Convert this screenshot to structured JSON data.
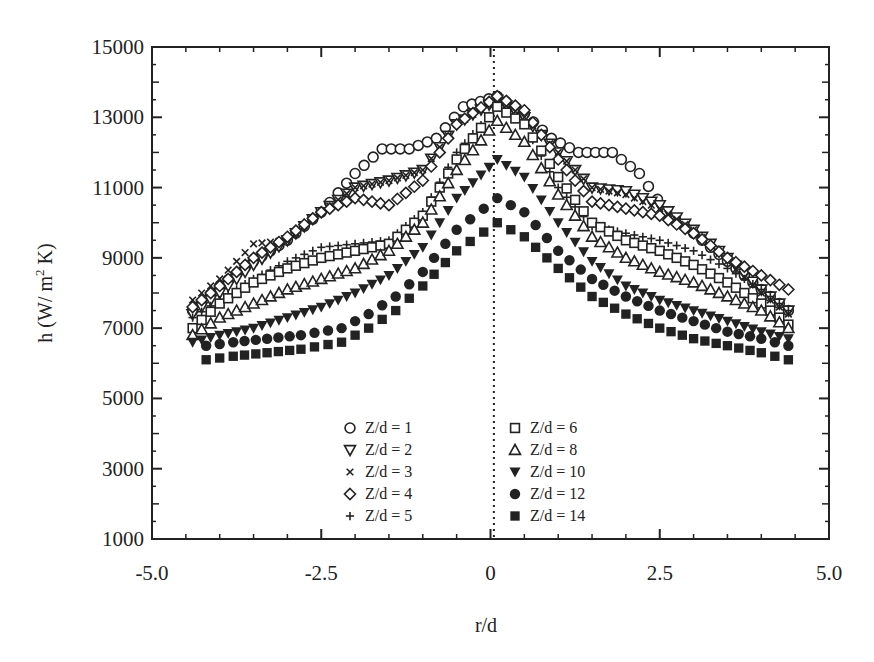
{
  "chart_data": {
    "type": "scatter",
    "title": "",
    "xlabel": "r/d",
    "ylabel": "h (W/ m² K)",
    "ylabel_parts": {
      "main": "h (W/ m",
      "sup": "2",
      "tail": " K)"
    },
    "xlim": [
      -5.0,
      5.0
    ],
    "ylim": [
      1000,
      15000
    ],
    "x_ticks": [
      -5.0,
      -2.5,
      0,
      2.5,
      5.0
    ],
    "x_tick_labels": [
      "-5.0",
      "-2.5",
      "0",
      "2.5",
      "5.0"
    ],
    "y_ticks": [
      1000,
      3000,
      5000,
      7000,
      9000,
      11000,
      13000,
      15000
    ],
    "y_tick_labels": [
      "1000",
      "3000",
      "5000",
      "7000",
      "9000",
      "11000",
      "13000",
      "15000"
    ],
    "grid": false,
    "center_line": {
      "x": 0.05,
      "style": "dotted"
    },
    "legend_position": "lower center, two columns",
    "series": [
      {
        "name": "Z/d = 1",
        "marker": "circle-open",
        "x": [
          -4.4,
          -4.0,
          -3.5,
          -3.0,
          -2.5,
          -2.0,
          -1.6,
          -1.2,
          -0.8,
          -0.4,
          0.1,
          0.5,
          0.9,
          1.3,
          1.8,
          2.2,
          2.6,
          3.0,
          3.5,
          4.0,
          4.4
        ],
        "values": [
          7500,
          8200,
          8900,
          9500,
          10300,
          11400,
          12100,
          12100,
          12400,
          13300,
          13600,
          13100,
          12400,
          12000,
          12000,
          11400,
          10300,
          9700,
          8900,
          8100,
          7500
        ]
      },
      {
        "name": "Z/d = 2",
        "marker": "triangle-down-open",
        "x": [
          -4.4,
          -4.0,
          -3.5,
          -3.0,
          -2.5,
          -2.0,
          -1.5,
          -1.0,
          -0.5,
          0.1,
          0.5,
          1.0,
          1.5,
          2.0,
          2.5,
          3.0,
          3.5,
          4.0,
          4.4
        ],
        "values": [
          7400,
          8000,
          8800,
          9500,
          10300,
          11000,
          11200,
          11500,
          12800,
          13500,
          13000,
          12000,
          11000,
          10900,
          10500,
          9800,
          9000,
          8100,
          7500
        ]
      },
      {
        "name": "Z/d = 3",
        "marker": "x",
        "x": [
          -4.4,
          -4.0,
          -3.5,
          -3.0,
          -2.5,
          -2.0,
          -1.5,
          -1.0,
          -0.5,
          0.1,
          0.5,
          1.0,
          1.5,
          2.0,
          2.5,
          3.0,
          3.5,
          4.0,
          4.4
        ],
        "values": [
          7800,
          8400,
          9400,
          9500,
          10300,
          11000,
          11200,
          11500,
          12800,
          13500,
          13000,
          12000,
          11000,
          10800,
          10400,
          9800,
          8900,
          8000,
          7400
        ]
      },
      {
        "name": "Z/d = 4",
        "marker": "diamond-open",
        "x": [
          -4.4,
          -4.0,
          -3.5,
          -3.0,
          -2.5,
          -2.0,
          -1.5,
          -1.0,
          -0.5,
          0.1,
          0.5,
          1.0,
          1.5,
          2.0,
          2.5,
          3.0,
          3.5,
          4.0,
          4.4
        ],
        "values": [
          7600,
          8200,
          9000,
          9600,
          10300,
          10700,
          10500,
          11200,
          12800,
          13600,
          13200,
          11800,
          10600,
          10400,
          10200,
          9700,
          9000,
          8500,
          8100
        ]
      },
      {
        "name": "Z/d = 5",
        "marker": "plus",
        "x": [
          -4.4,
          -4.0,
          -3.5,
          -3.0,
          -2.5,
          -2.0,
          -1.5,
          -1.0,
          -0.5,
          0.1,
          0.5,
          1.0,
          1.5,
          2.0,
          2.5,
          3.0,
          3.5,
          4.0,
          4.4
        ],
        "values": [
          7300,
          7800,
          8400,
          8900,
          9300,
          9400,
          9500,
          10300,
          12000,
          13300,
          12800,
          11000,
          9900,
          9700,
          9500,
          9200,
          8700,
          8100,
          7500
        ]
      },
      {
        "name": "Z/d = 6",
        "marker": "square-open",
        "x": [
          -4.4,
          -4.0,
          -3.5,
          -3.0,
          -2.5,
          -2.0,
          -1.5,
          -1.0,
          -0.5,
          0.1,
          0.5,
          1.0,
          1.5,
          2.0,
          2.5,
          3.0,
          3.5,
          4.0,
          4.4
        ],
        "values": [
          7000,
          7700,
          8300,
          8700,
          9000,
          9200,
          9400,
          10200,
          11800,
          13300,
          12800,
          11300,
          10000,
          9500,
          9200,
          8800,
          8300,
          7700,
          7100
        ]
      },
      {
        "name": "Z/d = 8",
        "marker": "triangle-up-open",
        "x": [
          -4.4,
          -4.0,
          -3.5,
          -3.0,
          -2.5,
          -2.0,
          -1.5,
          -1.0,
          -0.5,
          0.1,
          0.5,
          1.0,
          1.5,
          2.0,
          2.5,
          3.0,
          3.5,
          4.0,
          4.4
        ],
        "values": [
          6800,
          7300,
          7700,
          8100,
          8400,
          8700,
          9200,
          10000,
          11500,
          12900,
          12300,
          10800,
          9600,
          9000,
          8600,
          8300,
          7900,
          7500,
          7000
        ]
      },
      {
        "name": "Z/d = 10",
        "marker": "triangle-down-filled",
        "x": [
          -4.4,
          -4.0,
          -3.5,
          -3.0,
          -2.5,
          -2.0,
          -1.5,
          -1.0,
          -0.5,
          0.1,
          0.5,
          1.0,
          1.5,
          2.0,
          2.5,
          3.0,
          3.5,
          4.0,
          4.4
        ],
        "values": [
          6600,
          6800,
          7000,
          7300,
          7600,
          8000,
          8500,
          9300,
          10700,
          11800,
          11300,
          10000,
          8900,
          8200,
          7800,
          7500,
          7200,
          6900,
          6700
        ]
      },
      {
        "name": "Z/d = 12",
        "marker": "circle-filled",
        "x": [
          -4.2,
          -3.8,
          -3.3,
          -2.8,
          -2.2,
          -1.8,
          -1.4,
          -1.0,
          -0.5,
          0.1,
          0.5,
          1.0,
          1.5,
          2.0,
          2.5,
          3.0,
          3.5,
          4.0,
          4.4
        ],
        "values": [
          6500,
          6600,
          6700,
          6800,
          7000,
          7400,
          7900,
          8600,
          9800,
          10700,
          10300,
          9200,
          8400,
          7900,
          7500,
          7200,
          6900,
          6700,
          6500
        ]
      },
      {
        "name": "Z/d = 14",
        "marker": "square-filled",
        "x": [
          -4.2,
          -3.8,
          -3.3,
          -2.8,
          -2.2,
          -1.8,
          -1.4,
          -1.0,
          -0.5,
          0.1,
          0.5,
          1.0,
          1.5,
          2.0,
          2.5,
          3.0,
          3.5,
          4.0,
          4.4
        ],
        "values": [
          6100,
          6200,
          6300,
          6400,
          6600,
          7000,
          7500,
          8200,
          9200,
          10000,
          9600,
          8700,
          7900,
          7400,
          7000,
          6700,
          6500,
          6300,
          6100
        ]
      }
    ]
  },
  "legend": {
    "left": [
      {
        "symbol": "circle-open",
        "label": "Z/d = 1"
      },
      {
        "symbol": "triangle-down-open",
        "label": "Z/d = 2"
      },
      {
        "symbol": "x",
        "label": "Z/d = 3"
      },
      {
        "symbol": "diamond-open",
        "label": "Z/d = 4"
      },
      {
        "symbol": "plus",
        "label": "Z/d = 5"
      }
    ],
    "right": [
      {
        "symbol": "square-open",
        "label": "Z/d = 6"
      },
      {
        "symbol": "triangle-up-open",
        "label": "Z/d = 8"
      },
      {
        "symbol": "triangle-down-filled",
        "label": "Z/d = 10"
      },
      {
        "symbol": "circle-filled",
        "label": "Z/d = 12"
      },
      {
        "symbol": "square-filled",
        "label": "Z/d = 14"
      }
    ]
  },
  "style": {
    "ink_color": "#222222",
    "background": "#ffffff"
  }
}
